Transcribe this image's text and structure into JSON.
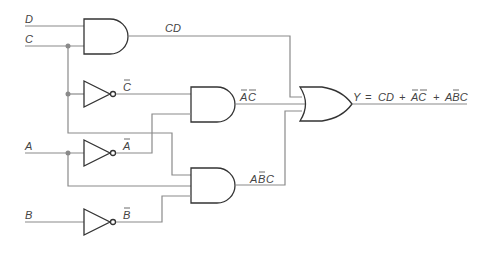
{
  "diagram": {
    "type": "logic-circuit",
    "inputs": [
      {
        "name": "D",
        "label": "D"
      },
      {
        "name": "C",
        "label": "C"
      },
      {
        "name": "A",
        "label": "A"
      },
      {
        "name": "B",
        "label": "B"
      }
    ],
    "inverters": [
      {
        "input": "C",
        "output_label": "C"
      },
      {
        "input": "A",
        "output_label": "A"
      },
      {
        "input": "B",
        "output_label": "B"
      }
    ],
    "and_gates": [
      {
        "inputs": [
          "D",
          "C"
        ],
        "output_label": "CD"
      },
      {
        "inputs": [
          "C̄",
          "Ā"
        ],
        "output_label_parts": [
          "A",
          "C"
        ],
        "output_text": "ĀC̄"
      },
      {
        "inputs": [
          "C",
          "A",
          "B̄"
        ],
        "output_label_parts": [
          "A",
          "B",
          "C"
        ],
        "output_text": "AB̄C"
      }
    ],
    "or_gate": {
      "inputs": [
        "CD",
        "ĀC̄",
        "AB̄C"
      ],
      "output_prefix": "Y",
      "equals": "=",
      "terms": [
        "CD",
        "+",
        "AC",
        "+",
        "ABC"
      ],
      "output_text": "Y = CD + ĀC̄ + AB̄C"
    },
    "colors": {
      "wire": "#8a8a8a",
      "gate_outline": "#333333",
      "label": "#444444"
    }
  }
}
